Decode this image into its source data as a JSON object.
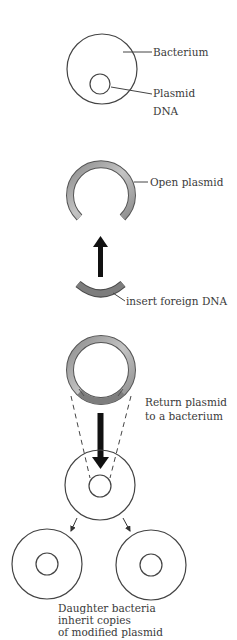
{
  "labels": {
    "bacterium": "Bacterium",
    "plasmid_line1": "Plasmid",
    "plasmid_line2": "DNA",
    "open_plasmid": "Open plasmid",
    "insert_foreign_dna": "insert foreign DNA",
    "return_line1": "Return plasmid",
    "return_line2": "to a bacterium",
    "daughter_line1": "Daughter bacteria",
    "daughter_line2": "inherit copies",
    "daughter_line3": "of modified plasmid"
  },
  "colors": {
    "outline": "#444444",
    "plasmid_fill": "#a9a9a9",
    "foreign_dna_fill": "#7d7d7d",
    "arrow": "#111111",
    "text": "#3a3a3a"
  }
}
